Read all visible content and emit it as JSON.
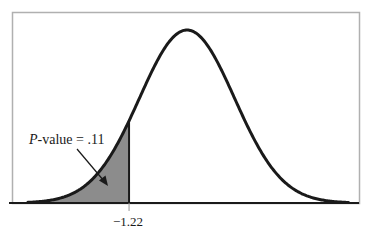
{
  "chart_data": {
    "type": "area",
    "title": "",
    "distribution": "standard normal",
    "xlabel": "",
    "ylabel": "",
    "x_tick_labels": [
      "−1.22"
    ],
    "critical_value": -1.22,
    "shaded_region": {
      "side": "left",
      "from": "-inf",
      "to": -1.22,
      "area": 0.11
    },
    "annotation": {
      "label_italic": "P",
      "label_rest": "-value = .11",
      "full_text": "P-value = .11",
      "points_to": "shaded left tail"
    },
    "x_range": [
      -3.3,
      3.3
    ],
    "grid": false,
    "legend": "none",
    "frame": true
  },
  "colors": {
    "curve": "#1a1a1a",
    "shade": "#8c8c8c",
    "frame": "#b0b0b0",
    "baseline": "#1a1a1a",
    "text": "#1a1a1a"
  },
  "geometry": {
    "mean_px": 187,
    "sigma_px": 47.5,
    "baseline_y": 203,
    "peak_y": 30,
    "z_min": -3.35,
    "z_max": 3.4
  }
}
